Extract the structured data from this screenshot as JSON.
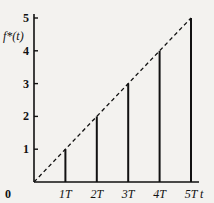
{
  "chart_data": {
    "type": "bar",
    "subtype": "stem",
    "title": "",
    "xlabel": "t",
    "ylabel": "f*(t)",
    "categories": [
      "1T",
      "2T",
      "3T",
      "4T",
      "5T"
    ],
    "x": [
      1,
      2,
      3,
      4,
      5
    ],
    "values": [
      1,
      2,
      3,
      4,
      5
    ],
    "series": [
      {
        "name": "samples f*(t)",
        "style": "solid stems",
        "x": [
          1,
          2,
          3,
          4,
          5
        ],
        "values": [
          1,
          2,
          3,
          4,
          5
        ]
      },
      {
        "name": "f(t) = t",
        "style": "dashed line",
        "x": [
          0,
          5
        ],
        "values": [
          0,
          5
        ]
      }
    ],
    "x_tick_labels": [
      "0",
      "1T",
      "2T",
      "3T",
      "4T",
      "5T"
    ],
    "y_tick_labels": [
      "1",
      "2",
      "3",
      "4",
      "5"
    ],
    "xlim": [
      0,
      5.3
    ],
    "ylim": [
      0,
      5
    ],
    "grid": false,
    "legend": "none"
  },
  "labels": {
    "origin": "0",
    "x_axis": "t",
    "y_axis": "f*(t)"
  },
  "colors": {
    "background": "#f3f2ef",
    "ink": "#111111"
  }
}
